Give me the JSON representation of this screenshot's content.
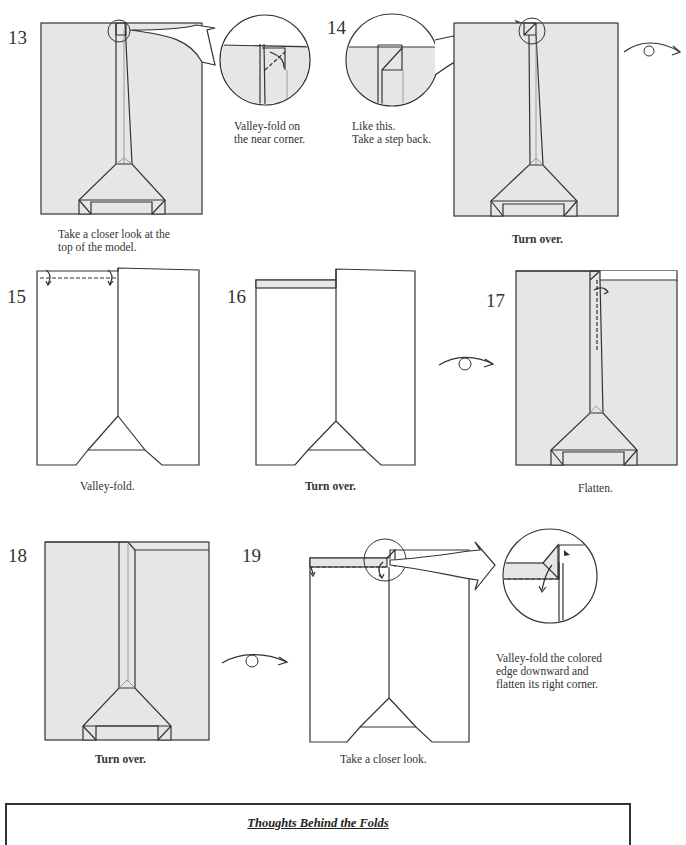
{
  "steps": [
    {
      "number": "13",
      "caption": "Take a closer look at the top of the model.",
      "zoom_caption": "Valley-fold on the near corner."
    },
    {
      "number": "14",
      "caption": "Turn over.",
      "zoom_caption": "Like this. Take a step back."
    },
    {
      "number": "15",
      "caption": "Valley-fold."
    },
    {
      "number": "16",
      "caption": "Turn over."
    },
    {
      "number": "17",
      "caption": "Flatten."
    },
    {
      "number": "18",
      "caption": "Turn over."
    },
    {
      "number": "19",
      "caption": "Take a closer look.",
      "zoom_caption": "Valley-fold the colored edge downward and flatten its right corner."
    }
  ],
  "captions": {
    "s13_line1": "Take a closer look at the",
    "s13_line2": "top of the model.",
    "s13_zoom_line1": "Valley-fold on",
    "s13_zoom_line2": "the near corner.",
    "s14_zoom_line1": "Like this.",
    "s14_zoom_line2": "Take a step back.",
    "s19_zoom_line1": "Valley-fold the colored",
    "s19_zoom_line2": "edge downward and",
    "s19_zoom_line3": "flatten its right corner."
  },
  "icons": [
    "turn-over-icon",
    "zoom-circle-icon",
    "valley-fold-arrow-icon"
  ],
  "colors": {
    "paper_colored": "#e6e6e6",
    "paper_white": "#ffffff",
    "line": "#333333"
  },
  "thoughts_box": {
    "title": "Thoughts Behind the Folds"
  }
}
